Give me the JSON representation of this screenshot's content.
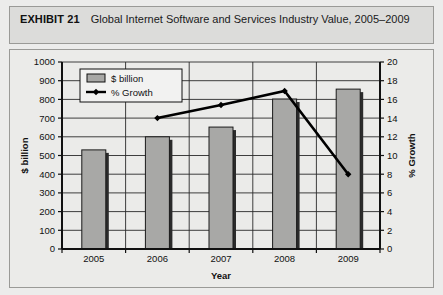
{
  "exhibit": {
    "label": "EXHIBIT 21",
    "title": "Global Internet Software and Services Industry Value, 2005–2009"
  },
  "chart_data": {
    "type": "bar",
    "title": "",
    "categories": [
      "2005",
      "2006",
      "2007",
      "2008",
      "2009"
    ],
    "xlabel": "Year",
    "ylabel": "$ billion",
    "y2label": "% Growth",
    "ylim": [
      0,
      1000
    ],
    "y2lim": [
      0,
      20
    ],
    "yticks": [
      "1000",
      "900",
      "800",
      "700",
      "600",
      "500",
      "400",
      "300",
      "200",
      "100",
      "0"
    ],
    "ytick_values": [
      1000,
      900,
      800,
      700,
      600,
      500,
      400,
      300,
      200,
      100,
      0
    ],
    "y2ticks": [
      "20",
      "18",
      "16",
      "14",
      "12",
      "10",
      "8",
      "6",
      "4",
      "2",
      "0"
    ],
    "y2tick_values": [
      20,
      18,
      16,
      14,
      12,
      10,
      8,
      6,
      4,
      2,
      0
    ],
    "grid": true,
    "legend_position": "top-left",
    "series": [
      {
        "name": "$ billion",
        "type": "bar",
        "axis": "left",
        "color": "#a8a8a6",
        "values": [
          530,
          600,
          652,
          802,
          855
        ]
      },
      {
        "name": "% Growth",
        "type": "line",
        "axis": "right",
        "color": "#000000",
        "values": [
          null,
          14.0,
          15.4,
          16.9,
          8.0
        ]
      }
    ]
  },
  "colors": {
    "bar_fill": "#a8a8a6",
    "bar_edge": "#1a1a1a",
    "line": "#000000",
    "frame": "#9a9a97",
    "header_bg": "#dcdcda",
    "plot_bg": "#ebebe9"
  }
}
